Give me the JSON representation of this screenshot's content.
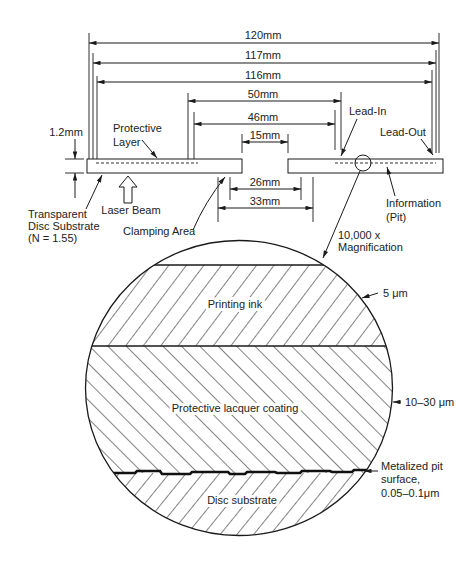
{
  "colors": {
    "background": "#ffffff",
    "line": "#1a1a1a",
    "text": "#222222"
  },
  "dimensions": {
    "outer_diameter": "120mm",
    "d117": "117mm",
    "d116": "116mm",
    "d50": "50mm",
    "d46": "46mm",
    "center_hole": "15mm",
    "d26": "26mm",
    "d33": "33mm",
    "thickness": "1.2mm"
  },
  "labels": {
    "protective_layer": [
      "Protective",
      "Layer"
    ],
    "transparent_substrate": [
      "Transparent",
      "Disc Substrate",
      "(N = 1.55)"
    ],
    "laser_beam": "Laser Beam",
    "clamping_area": "Clamping Area",
    "lead_in": "Lead-In",
    "lead_out": "Lead-Out",
    "information": [
      "Information",
      "(Pit)"
    ],
    "magnification": [
      "10,000 x",
      "Magnification"
    ]
  },
  "magnified_view": {
    "layers": [
      {
        "name": "Printing ink",
        "thickness": "5 μm"
      },
      {
        "name": "Protective lacquer coating",
        "thickness": "10–30 μm"
      },
      {
        "name": "Disc substrate"
      }
    ],
    "metalized_surface": [
      "Metalized pit",
      "surface,",
      "0.05–0.1μm"
    ]
  }
}
